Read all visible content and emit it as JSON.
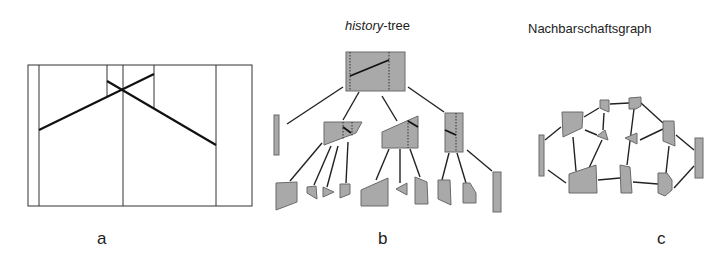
{
  "panels": {
    "a": {
      "label": "a"
    },
    "b": {
      "label": "b",
      "title_italic": "history",
      "title_rest": "-tree"
    },
    "c": {
      "label": "c",
      "title": "Nachbarschaftsgraph"
    }
  },
  "colors": {
    "fill": "#a9a9a9",
    "stroke": "#555555",
    "line": "#222222"
  }
}
